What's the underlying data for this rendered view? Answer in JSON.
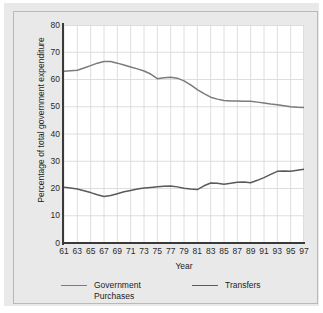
{
  "chart_data": {
    "type": "line",
    "title": "",
    "xlabel": "Year",
    "ylabel": "Percentage of total government expenditure",
    "xlim": [
      61,
      97
    ],
    "ylim": [
      0,
      80
    ],
    "grid": true,
    "legend_position": "bottom",
    "y_ticks": [
      80,
      70,
      60,
      50,
      40,
      30,
      20,
      10,
      0
    ],
    "x_ticks": [
      61,
      63,
      65,
      67,
      69,
      71,
      73,
      75,
      77,
      79,
      81,
      83,
      85,
      87,
      89,
      91,
      93,
      95,
      97
    ],
    "x": [
      61,
      62,
      63,
      64,
      65,
      66,
      67,
      68,
      69,
      70,
      71,
      72,
      73,
      74,
      75,
      76,
      77,
      78,
      79,
      80,
      81,
      82,
      83,
      84,
      85,
      86,
      87,
      88,
      89,
      90,
      91,
      92,
      93,
      94,
      95,
      96,
      97
    ],
    "series": [
      {
        "name": "Government Purchases",
        "color": "#7b7b7b",
        "values": [
          63.0,
          63.2,
          63.4,
          64.2,
          65.1,
          66.0,
          66.6,
          66.6,
          66.0,
          65.3,
          64.6,
          63.9,
          63.1,
          62.0,
          60.3,
          60.6,
          60.8,
          60.5,
          59.5,
          58.0,
          56.3,
          54.8,
          53.5,
          52.8,
          52.3,
          52.1,
          52.1,
          52.0,
          52.0,
          51.7,
          51.4,
          51.0,
          50.7,
          50.4,
          50.0,
          49.8,
          49.7
        ]
      },
      {
        "name": "Transfers",
        "color": "#5a5a5a",
        "values": [
          20.5,
          20.2,
          19.8,
          19.2,
          18.5,
          17.7,
          17.1,
          17.4,
          18.1,
          18.8,
          19.3,
          19.8,
          20.2,
          20.4,
          20.6,
          20.8,
          20.9,
          20.6,
          20.1,
          19.8,
          19.6,
          21.0,
          22.0,
          21.9,
          21.6,
          21.9,
          22.3,
          22.4,
          22.1,
          23.0,
          24.0,
          25.2,
          26.3,
          26.4,
          26.3,
          26.7,
          27.1
        ]
      }
    ]
  },
  "legend": {
    "entries": [
      {
        "label": "Government\nPurchases",
        "color": "#7b7b7b"
      },
      {
        "label": "Transfers",
        "color": "#5a5a5a"
      }
    ]
  },
  "colors": {
    "panel_background": "#e9e9e9",
    "plot_background": "#ffffff",
    "grid": "#d6d6d6",
    "axis": "#3a3a3a",
    "text": "#1d1d1d"
  }
}
